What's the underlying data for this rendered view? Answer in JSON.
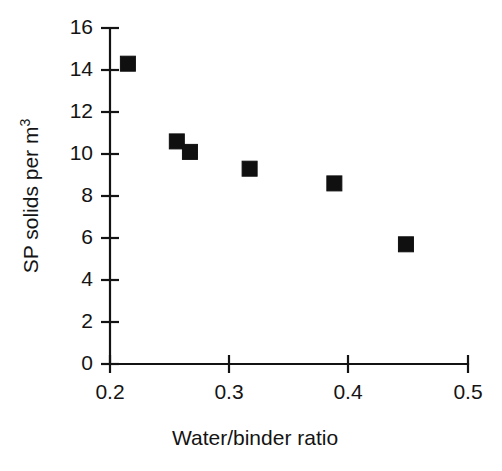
{
  "chart_data": {
    "type": "scatter",
    "title": "",
    "xlabel": "Water/binder ratio",
    "ylabel": "SP solids per m",
    "ylabel_superscript": "3",
    "ylabel_full": "SP solids per m³",
    "xlim": [
      0.2,
      0.5
    ],
    "ylim": [
      0,
      16
    ],
    "xticks": [
      0.2,
      0.3,
      0.4,
      0.5
    ],
    "xtick_labels": [
      "0.2",
      "0.3",
      "0.4",
      "0.5"
    ],
    "yticks": [
      0,
      2,
      4,
      6,
      8,
      10,
      12,
      14,
      16
    ],
    "ytick_labels": [
      "0",
      "2",
      "4",
      "6",
      "8",
      "10",
      "12",
      "14",
      "16"
    ],
    "grid": false,
    "legend": false,
    "marker": "filled-square",
    "marker_color": "#101010",
    "series": [
      {
        "name": "SP solids",
        "points": [
          {
            "x": 0.215,
            "y": 14.3
          },
          {
            "x": 0.256,
            "y": 10.6
          },
          {
            "x": 0.267,
            "y": 10.1
          },
          {
            "x": 0.317,
            "y": 9.3
          },
          {
            "x": 0.388,
            "y": 8.6
          },
          {
            "x": 0.448,
            "y": 5.7
          }
        ]
      }
    ]
  },
  "axes": {
    "x_title": "Water/binder ratio",
    "y_title_main": "SP solids per m",
    "y_title_sup": "3"
  },
  "ticks": {
    "x": [
      "0.2",
      "0.3",
      "0.4",
      "0.5"
    ],
    "y": [
      "0",
      "2",
      "4",
      "6",
      "8",
      "10",
      "12",
      "14",
      "16"
    ]
  }
}
